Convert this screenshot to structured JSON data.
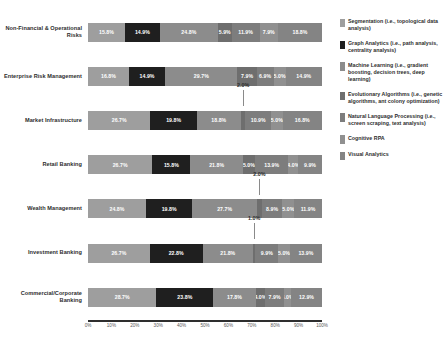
{
  "chart_data": {
    "type": "bar",
    "orientation": "horizontal",
    "stacked": true,
    "stack_mode": "percent",
    "title": "",
    "xlabel": "",
    "ylabel": "",
    "xlim": [
      0,
      100
    ],
    "grid": false,
    "legend_position": "right",
    "categories": [
      "Non-Financial & Operational Risks",
      "Enterprise Risk Management",
      "Market Infrastructure",
      "Retail Banking",
      "Wealth Management",
      "Investment Banking",
      "Commercial/Corporate Banking"
    ],
    "xticklabels": [
      "0%",
      "10%",
      "20%",
      "30%",
      "40%",
      "50%",
      "60%",
      "70%",
      "80%",
      "90%",
      "100%"
    ],
    "xtickvalues": [
      0,
      10,
      20,
      30,
      40,
      50,
      60,
      70,
      80,
      90,
      100
    ],
    "series": [
      {
        "name": "Segmentation (i.e., topological data analysis)",
        "color": "#9e9e9e",
        "values": [
          15.8,
          16.8,
          26.7,
          26.7,
          24.8,
          26.7,
          28.7
        ]
      },
      {
        "name": "Graph Analytics (i.e., path analysis, centrality analysis)",
        "color": "#1f1f1f",
        "values": [
          14.9,
          14.9,
          19.8,
          15.8,
          19.8,
          22.8,
          23.8
        ]
      },
      {
        "name": "Machine Learning (i.e., gradient boosting, decision trees, deep learning)",
        "color": "#8c8c8c",
        "values": [
          24.8,
          29.7,
          18.8,
          21.8,
          27.7,
          21.8,
          17.8
        ]
      },
      {
        "name": "Evolutionary Algorithms (i.e., genetic algorithms, ant colony optimization)",
        "color": "#6e6e6e",
        "values": [
          5.9,
          7.9,
          2.0,
          5.0,
          2.0,
          1.0,
          4.0
        ]
      },
      {
        "name": "Natural Language Processing (i.e., screen scraping, text analysis)",
        "color": "#7d7d7d",
        "values": [
          11.9,
          6.9,
          10.9,
          13.9,
          8.9,
          9.9,
          7.9
        ]
      },
      {
        "name": "Cognitive RPA",
        "color": "#909090",
        "values": [
          7.9,
          5.0,
          5.0,
          4.0,
          5.0,
          5.0,
          3.0
        ]
      },
      {
        "name": "Visual Analytics",
        "color": "#848484",
        "values": [
          18.8,
          14.9,
          16.8,
          9.9,
          11.9,
          13.9,
          12.9
        ]
      }
    ],
    "value_labels": [
      [
        "15.8%",
        "14.9%",
        "24.8%",
        "5.9%",
        "11.9%",
        "7.9%",
        "18.8%"
      ],
      [
        "16.8%",
        "14.9%",
        "29.7%",
        "7.9%",
        "6.9%",
        "5.0%",
        "14.9%"
      ],
      [
        "26.7%",
        "19.8%",
        "18.8%",
        "2.0%",
        "10.9%",
        "5.0%",
        "16.8%"
      ],
      [
        "26.7%",
        "15.8%",
        "21.8%",
        "5.0%",
        "13.9%",
        "4.0%",
        "9.9%"
      ],
      [
        "24.8%",
        "19.8%",
        "27.7%",
        "2.0%",
        "8.9%",
        "5.0%",
        "11.9%"
      ],
      [
        "26.7%",
        "22.8%",
        "21.8%",
        "1.0%",
        "9.9%",
        "5.0%",
        "13.9%"
      ],
      [
        "28.7%",
        "23.8%",
        "17.8%",
        "4.0%",
        "7.9%",
        "3.0%",
        "12.9%"
      ]
    ],
    "callouts": [
      {
        "row": 2,
        "series": 3,
        "label": "2.0%"
      },
      {
        "row": 4,
        "series": 3,
        "label": "2.0%"
      },
      {
        "row": 5,
        "series": 3,
        "label": "1.0%"
      }
    ]
  },
  "caption": {
    "text": ""
  }
}
